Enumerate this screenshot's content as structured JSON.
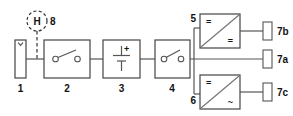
{
  "diagram": {
    "background": "#ffffff",
    "line_color": "#555555",
    "text_color": "#111111",
    "width": 293,
    "height": 116
  },
  "nodes": {
    "source": {
      "label": "1",
      "icon": "tank-icon",
      "description": "hydrogen tank"
    },
    "switch_left": {
      "label": "2",
      "icon": "switch-icon",
      "description": "switch"
    },
    "battery": {
      "label": "3",
      "icon": "battery-icon",
      "polarity": "+",
      "description": "battery"
    },
    "switch_right": {
      "label": "4",
      "icon": "switch-icon",
      "description": "switch"
    },
    "converter_dcdc": {
      "label": "5",
      "icon": "dc-dc-converter-icon",
      "input_symbol": "=",
      "output_symbol": "=",
      "description": "DC/DC converter"
    },
    "converter_dcac": {
      "label": "6",
      "icon": "dc-ac-inverter-icon",
      "input_symbol": "=",
      "output_symbol": "~",
      "description": "DC/AC inverter"
    },
    "load_a": {
      "label": "7a",
      "icon": "load-icon",
      "description": "load"
    },
    "load_b": {
      "label": "7b",
      "icon": "load-icon",
      "description": "load"
    },
    "load_c": {
      "label": "7c",
      "icon": "load-icon",
      "description": "load"
    },
    "sensor": {
      "label": "8",
      "symbol": "H",
      "icon": "hydrogen-sensor-icon",
      "description": "hydrogen sensor"
    }
  }
}
